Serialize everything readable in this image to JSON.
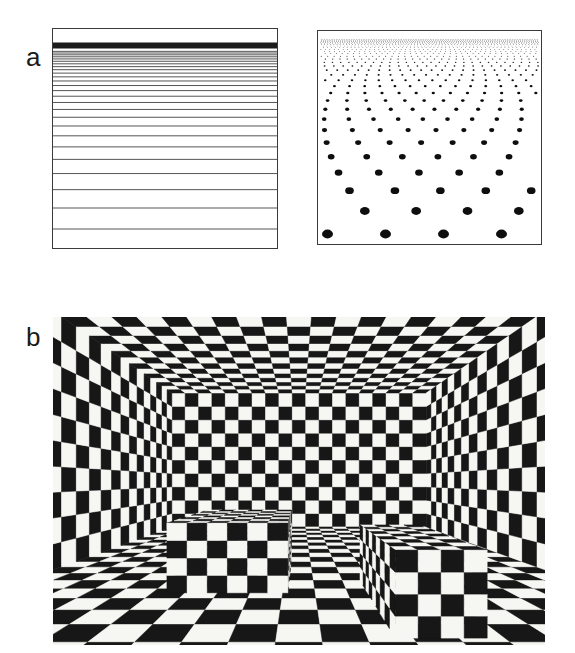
{
  "figure": {
    "background": "#ffffff",
    "panel_a": {
      "label": "a",
      "line_gradient": {
        "name": "horizontal-line texture gradient of a receding ground plane",
        "width": 226,
        "height": 221,
        "border_color": "#3a3a3a",
        "line_color": "#1c1c1c",
        "band": {
          "y": 14.5,
          "height": 6
        },
        "lines": {
          "y_start": 201,
          "y_end": 22.5,
          "max_spacing": 21,
          "exponent": 1.22,
          "stroke_width": 0.75
        }
      },
      "dot_gradient": {
        "name": "dot-lattice texture gradient of a receding ground plane",
        "width": 225,
        "height": 215,
        "border_color": "#3a3a3a",
        "dot_color": "#0e0e0e",
        "dots": {
          "horizon_y": 4,
          "first_offset": 200,
          "decay": 0.885,
          "rows": 30,
          "rx": 5.5,
          "ry": 4.4,
          "x_spacing": 58,
          "center_x": 112,
          "min_r": 0.35
        }
      }
    },
    "panel_b": {
      "label": "b",
      "room": {
        "name": "checkerboard-textured room containing two checkered blocks",
        "width": 492,
        "height": 328,
        "tiles_wide": 19,
        "tiles_high": 10,
        "tiles_deep": 28,
        "focal": 375,
        "eye_x": 9.5,
        "eye_y": 3.43,
        "black": "#171717",
        "white": "#f6f6f3",
        "boxes": [
          {
            "x0": 5.45,
            "x1": 9.16,
            "top": 2.14,
            "z0": 11.5,
            "z1": 16.7,
            "cols": 6,
            "rows": 4,
            "depth_cols": 8,
            "visible_side": "right",
            "parity": 0
          },
          {
            "x0": 11.6,
            "x1": 13.61,
            "top": 1.92,
            "z0": 8.19,
            "z1": 12.9,
            "cols": 4,
            "rows": 4,
            "depth_cols": 9,
            "visible_side": "left",
            "parity": 1
          }
        ]
      }
    }
  }
}
